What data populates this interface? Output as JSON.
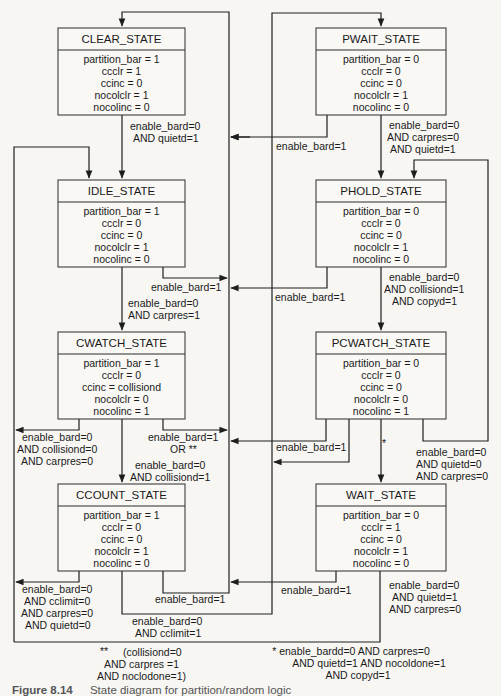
{
  "states": [
    {
      "id": "clear",
      "title": "CLEAR_STATE",
      "vars": [
        "partition_bar = 1",
        "ccclr = 1",
        "ccinc = 0",
        "nocolclr = 1",
        "nocolinc = 0"
      ]
    },
    {
      "id": "idle",
      "title": "IDLE_STATE",
      "vars": [
        "partition_bar = 1",
        "ccclr = 0",
        "ccinc = 0",
        "nocolclr = 1",
        "nocolinc = 0"
      ]
    },
    {
      "id": "cwatch",
      "title": "CWATCH_STATE",
      "vars": [
        "partition_bar = 1",
        "ccclr = 0",
        "ccinc = collisiond",
        "nocolclr = 0",
        "nocolinc = 1"
      ]
    },
    {
      "id": "ccount",
      "title": "CCOUNT_STATE",
      "vars": [
        "partition_bar = 1",
        "ccclr = 0",
        "ccinc = 0",
        "nocolclr = 1",
        "nocolinc = 0"
      ]
    },
    {
      "id": "pwait",
      "title": "PWAIT_STATE",
      "vars": [
        "partition_bar = 0",
        "ccclr = 0",
        "ccinc = 0",
        "nocolclr = 1",
        "nocolinc = 0"
      ]
    },
    {
      "id": "phold",
      "title": "PHOLD_STATE",
      "vars": [
        "partition_bar = 0",
        "ccclr = 0",
        "ccinc = 0",
        "nocolclr = 1",
        "nocolinc = 0"
      ]
    },
    {
      "id": "pcwatch",
      "title": "PCWATCH_STATE",
      "vars": [
        "partition_bar = 0",
        "ccclr = 0",
        "ccinc = 0",
        "nocolclr = 0",
        "nocolinc = 1"
      ]
    },
    {
      "id": "wait",
      "title": "WAIT_STATE",
      "vars": [
        "partition_bar = 0",
        "ccclr = 1",
        "ccinc = 0",
        "nocolclr = 1",
        "nocolinc = 0"
      ]
    }
  ],
  "transitions": {
    "clear_to_idle": [
      "enable_bard=0",
      "AND quietd=1"
    ],
    "pwait_to_bus": [
      "enable_bard=1"
    ],
    "pwait_to_phold": [
      "enable_bard=0",
      "AND carpres=0",
      "AND quietd=1"
    ],
    "idle_to_bus": [
      "enable_bard=1"
    ],
    "idle_to_cwatch": [
      "enable_bard=0",
      "AND carpres=1"
    ],
    "phold_to_bus": [
      "enable_bard=1"
    ],
    "phold_to_pcwatch": [
      "enable_bard=0",
      "AND collisiond=1",
      "AND copyd=1"
    ],
    "cwatch_to_left": [
      "enable_bard=0",
      "AND collisiond=0",
      "AND carpres=0"
    ],
    "cwatch_to_bus": [
      "enable_bard=1",
      "OR  **"
    ],
    "cwatch_to_ccount": [
      "enable_bard=0",
      "AND collisiond=1"
    ],
    "pcwatch_to_bus": [
      "enable_bard=1"
    ],
    "pcwatch_to_wait": [
      "*"
    ],
    "pcwatch_to_phold": [
      "enable_bard=0",
      "AND quietd=0",
      "AND carpres=0"
    ],
    "ccount_to_left": [
      "enable_bard=0",
      "AND cclimit=0",
      "AND carpres=0",
      "AND quietd=0"
    ],
    "ccount_to_bus": [
      "enable_bard=1"
    ],
    "ccount_to_pwait": [
      "enable_bard=0",
      "AND cclimit=1"
    ],
    "wait_to_bus": [
      "enable_bard=1"
    ],
    "wait_to_idle": [
      "enable_bard=0",
      "AND quietd=1",
      "AND carpres=0"
    ]
  },
  "footnotes": {
    "double_star": [
      "**",
      "(collisiond=0",
      "AND carpres =1",
      "AND noclodone=1)"
    ],
    "single_star": [
      "* enable_bardd=0 AND carpres=0",
      "AND quietd=1 AND nocoldone=1",
      "AND copyd=1"
    ]
  },
  "caption": {
    "number": "Figure 8.14",
    "text": "State diagram for partition/random logic"
  }
}
